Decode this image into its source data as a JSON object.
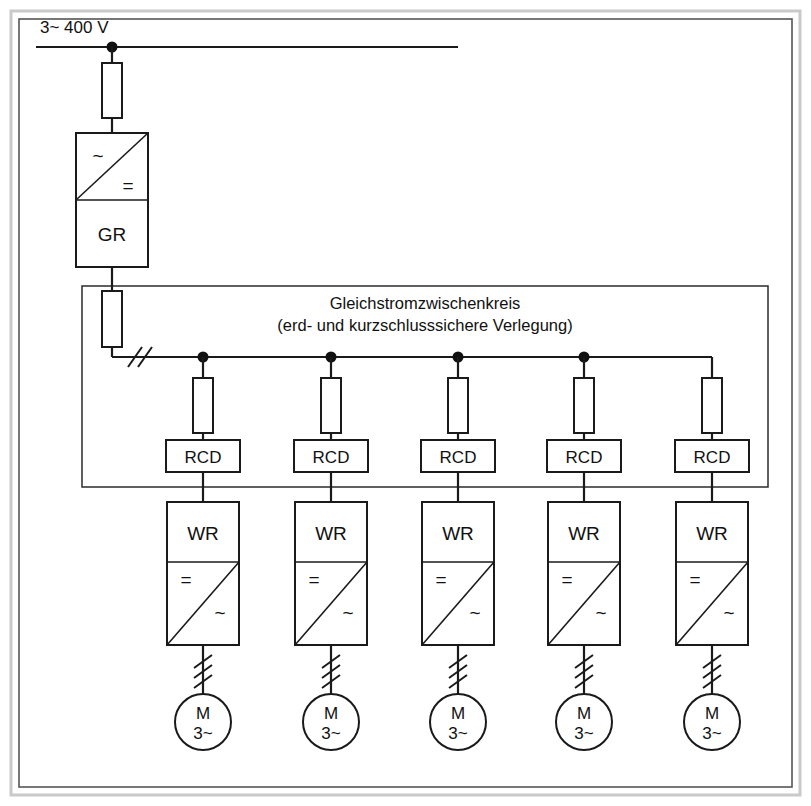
{
  "diagram": {
    "title_supply": "3~ 400 V",
    "dc_bus": {
      "line1": "Gleichstromzwischenkreis",
      "line2": "(erd- und kurzschlusssichere Verlegung)"
    },
    "rectifier": {
      "name_label": "GR",
      "input_symbol": "~",
      "output_symbol": "="
    },
    "inverter": {
      "name_label": "WR",
      "input_symbol": "=",
      "output_symbol": "~"
    },
    "rcd_label": "RCD",
    "motor": {
      "symbol": "M",
      "phases": "3~"
    },
    "branches": [
      {
        "rcd": "RCD",
        "inverter": "WR",
        "in_sym": "=",
        "out_sym": "~",
        "motor_sym": "M",
        "motor_phases": "3~"
      },
      {
        "rcd": "RCD",
        "inverter": "WR",
        "in_sym": "=",
        "out_sym": "~",
        "motor_sym": "M",
        "motor_phases": "3~"
      },
      {
        "rcd": "RCD",
        "inverter": "WR",
        "in_sym": "=",
        "out_sym": "~",
        "motor_sym": "M",
        "motor_phases": "3~"
      },
      {
        "rcd": "RCD",
        "inverter": "WR",
        "in_sym": "=",
        "out_sym": "~",
        "motor_sym": "M",
        "motor_phases": "3~"
      },
      {
        "rcd": "RCD",
        "inverter": "WR",
        "in_sym": "=",
        "out_sym": "~",
        "motor_sym": "M",
        "motor_phases": "3~"
      }
    ],
    "colors": {
      "line": "#1a1a1a",
      "frame_outer": "#c9c9c9",
      "frame_inner": "#555555",
      "background": "#ffffff"
    }
  }
}
